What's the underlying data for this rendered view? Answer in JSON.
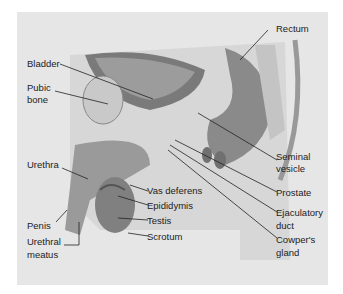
{
  "figure": {
    "labels": {
      "rectum": "Rectum",
      "bladder": "Bladder",
      "pubic_bone_1": "Pubic",
      "pubic_bone_2": "bone",
      "urethra": "Urethra",
      "seminal_1": "Seminal",
      "seminal_2": "vesicle",
      "vas_deferens": "Vas deferens",
      "prostate": "Prostate",
      "epididymis": "Epididymis",
      "testis": "Testis",
      "ejaculatory_1": "Ejaculatory",
      "ejaculatory_2": "duct",
      "penis": "Penis",
      "scrotum": "Scrotum",
      "urethral_meatus_1": "Urethral",
      "urethral_meatus_2": "meatus",
      "cowpers_1": "Cowper's",
      "cowpers_2": "gland"
    },
    "colors": {
      "background": "#e6e6e6",
      "tissue": "#cfcfcf",
      "dark": "#6e6e6e",
      "mid": "#9a9a9a"
    }
  }
}
